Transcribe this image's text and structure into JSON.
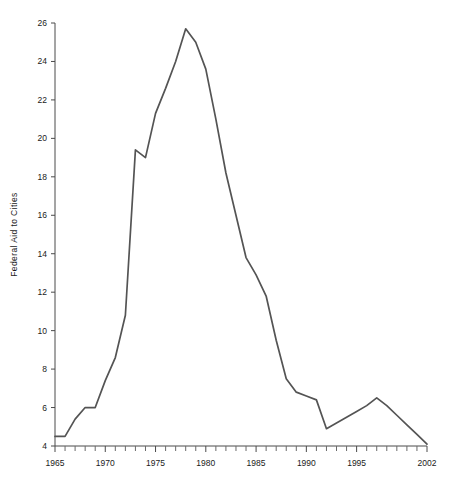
{
  "figure": {
    "background_color": "#ffffff",
    "line_color": "#545454",
    "axis_color": "#4a4a4a",
    "text_color": "#1a1a1a"
  },
  "chart_data": {
    "type": "line",
    "title": "",
    "subtitle": "",
    "xlabel": "",
    "ylabel": "Federal Aid to Cities",
    "xlim": [
      1965,
      2002
    ],
    "ylim": [
      4,
      26
    ],
    "grid": false,
    "legend_position": "none",
    "y_ticks": [
      4,
      6,
      8,
      10,
      12,
      14,
      16,
      18,
      20,
      22,
      24,
      26
    ],
    "y_tick_labels": [
      "4",
      "6",
      "8",
      "10",
      "12",
      "14",
      "16",
      "18",
      "20",
      "22",
      "24",
      "26"
    ],
    "y_tick_interval": 2,
    "x_ticks": [
      1965,
      1966,
      1967,
      1968,
      1969,
      1970,
      1971,
      1972,
      1973,
      1974,
      1975,
      1976,
      1977,
      1978,
      1979,
      1980,
      1981,
      1982,
      1983,
      1984,
      1985,
      1986,
      1987,
      1988,
      1989,
      1990,
      1991,
      1992,
      1993,
      1994,
      1995,
      1996,
      1997,
      1998,
      1999,
      2000,
      2001,
      2002
    ],
    "x_tick_interval": 1,
    "x_tick_labels": [
      {
        "value": 1965,
        "label": "1965"
      },
      {
        "value": 1970,
        "label": "1970"
      },
      {
        "value": 1975,
        "label": "1975"
      },
      {
        "value": 1980,
        "label": "1980"
      },
      {
        "value": 1985,
        "label": "1985"
      },
      {
        "value": 1990,
        "label": "1990"
      },
      {
        "value": 1995,
        "label": "1995"
      },
      {
        "value": 2002,
        "label": "2002"
      }
    ],
    "x": [
      1965,
      1966,
      1967,
      1968,
      1969,
      1970,
      1971,
      1972,
      1973,
      1974,
      1975,
      1976,
      1977,
      1978,
      1979,
      1980,
      1981,
      1982,
      1983,
      1984,
      1985,
      1986,
      1987,
      1988,
      1989,
      1990,
      1991,
      1992,
      1993,
      1994,
      1995,
      1996,
      1997,
      1998,
      1999,
      2000,
      2001,
      2002
    ],
    "values": [
      4.5,
      4.5,
      5.4,
      6.0,
      6.0,
      7.4,
      8.6,
      10.8,
      19.4,
      19.0,
      21.3,
      22.6,
      24.0,
      25.7,
      25.0,
      23.6,
      21.0,
      18.2,
      16.0,
      13.8,
      12.9,
      11.8,
      9.5,
      7.5,
      6.8,
      6.6,
      6.4,
      4.9,
      5.2,
      5.5,
      5.8,
      6.1,
      6.5,
      6.1,
      5.6,
      5.1,
      4.6,
      4.1
    ],
    "series": [
      {
        "name": "Federal Aid to Cities",
        "values": [
          4.5,
          4.5,
          5.4,
          6.0,
          6.0,
          7.4,
          8.6,
          10.8,
          19.4,
          19.0,
          21.3,
          22.6,
          24.0,
          25.7,
          25.0,
          23.6,
          21.0,
          18.2,
          16.0,
          13.8,
          12.9,
          11.8,
          9.5,
          7.5,
          6.8,
          6.6,
          6.4,
          4.9,
          5.2,
          5.5,
          5.8,
          6.1,
          6.5,
          6.1,
          5.6,
          5.1,
          4.6,
          4.1
        ]
      }
    ],
    "annotations": []
  }
}
